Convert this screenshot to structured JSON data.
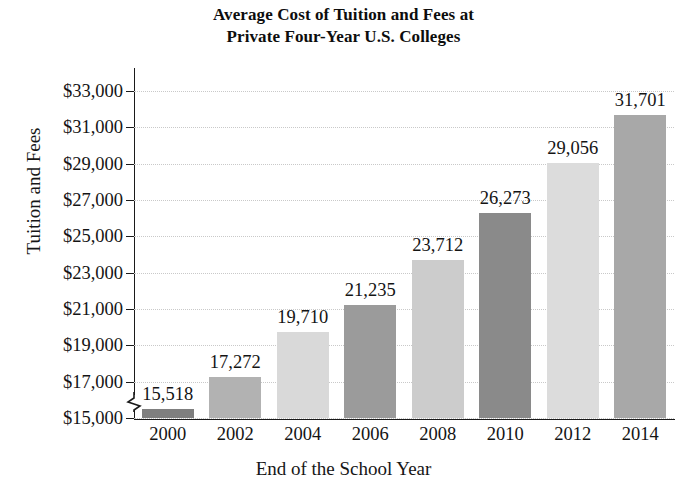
{
  "chart_data": {
    "type": "bar",
    "title": "Average Cost of Tuition and Fees at Private Four-Year U.S. Colleges",
    "title_lines": [
      "Average Cost of Tuition and Fees at",
      "Private Four-Year U.S. Colleges"
    ],
    "xlabel": "End of the School Year",
    "ylabel": "Tuition and Fees",
    "categories": [
      "2000",
      "2002",
      "2004",
      "2006",
      "2008",
      "2010",
      "2012",
      "2014"
    ],
    "values": [
      15518,
      17272,
      19710,
      21235,
      23712,
      26273,
      29056,
      31701
    ],
    "value_labels": [
      "15,518",
      "17,272",
      "19,710",
      "21,235",
      "23,712",
      "26,273",
      "29,056",
      "31,701"
    ],
    "bar_colors": [
      "#7f7f7f",
      "#b2b2b2",
      "#d9d9d9",
      "#9b9b9b",
      "#cccccc",
      "#8a8a8a",
      "#dcdcdc",
      "#a8a8a8"
    ],
    "ylim": [
      15000,
      33000
    ],
    "ytick_values": [
      15000,
      17000,
      19000,
      21000,
      23000,
      25000,
      27000,
      29000,
      31000,
      33000
    ],
    "ytick_labels": [
      "$15,000",
      "$17,000",
      "$19,000",
      "$21,000",
      "$23,000",
      "$25,000",
      "$27,000",
      "$29,000",
      "$31,000",
      "$33,000"
    ],
    "grid": true,
    "grid_axis": "y",
    "grid_style": "dotted",
    "legend": false,
    "axis_break": true,
    "axis_break_note": "y-axis broken below $15,000",
    "background_color": "#ffffff",
    "axis_color": "#1a1a1a",
    "gridline_color": "#c9c9c9",
    "text_color": "#141414"
  }
}
